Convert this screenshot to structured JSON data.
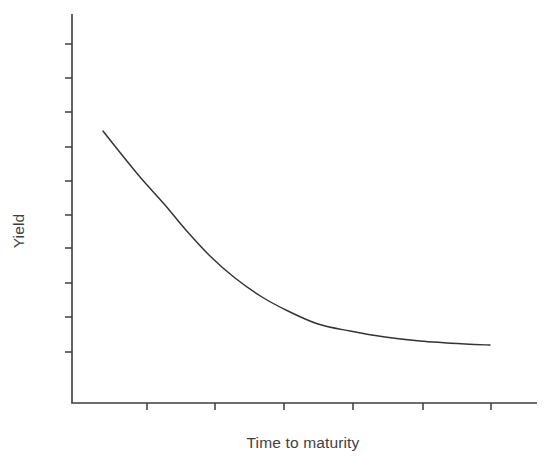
{
  "figure": {
    "background_color": "#ffffff",
    "line_color": "#333333",
    "axis_color": "#3c3c3c",
    "text_color": "#3f3f3f",
    "width": 554,
    "height": 472
  },
  "labels": {
    "y_axis_title": "Yield",
    "x_axis_title": "Time to maturity"
  },
  "chart_data": {
    "type": "line",
    "title": "",
    "subtitle": "",
    "xlabel": "Time to maturity",
    "ylabel": "Yield",
    "xlim": [
      0,
      10
    ],
    "ylim": [
      0,
      10
    ],
    "grid": false,
    "legend": null,
    "legend_position": "none",
    "annotations": [],
    "xtick_labels": [
      "",
      "",
      "",
      "",
      "",
      ""
    ],
    "ytick_labels": [
      "",
      "",
      "",
      "",
      "",
      "",
      "",
      "",
      "",
      ""
    ],
    "xticks_count": 6,
    "yticks_count": 10,
    "series": [
      {
        "name": "yield curve",
        "x": [
          0.67,
          1.0,
          1.4,
          1.9,
          2.4,
          3.0,
          3.6,
          4.3,
          5.0,
          5.7,
          6.4,
          7.2,
          8.0,
          8.8,
          9.0
        ],
        "y": [
          7.0,
          6.45,
          5.85,
          5.25,
          4.75,
          4.3,
          3.95,
          3.6,
          3.35,
          3.15,
          2.98,
          2.85,
          2.75,
          2.68,
          2.66
        ],
        "points_px": [
          [
            103,
            131
          ],
          [
            118,
            150
          ],
          [
            140,
            177
          ],
          [
            165,
            205
          ],
          [
            185,
            229
          ],
          [
            210,
            256
          ],
          [
            235,
            278
          ],
          [
            262,
            297
          ],
          [
            288,
            311
          ],
          [
            318,
            324
          ],
          [
            350,
            331
          ],
          [
            385,
            337
          ],
          [
            420,
            341
          ],
          [
            465,
            344
          ],
          [
            490,
            345
          ]
        ]
      }
    ]
  },
  "axes_geometry": {
    "y_axis_x_px": 72,
    "y_axis_top_px": 14,
    "y_axis_bottom_px": 403,
    "x_axis_y_px": 403,
    "x_axis_left_px": 72,
    "x_axis_right_px": 537,
    "y_tick_positions_px": [
      44,
      78,
      112,
      147,
      181,
      215,
      248,
      283,
      317,
      352
    ],
    "x_tick_positions_px": [
      147,
      215,
      284,
      353,
      423,
      491
    ],
    "tick_length_px": 7
  }
}
